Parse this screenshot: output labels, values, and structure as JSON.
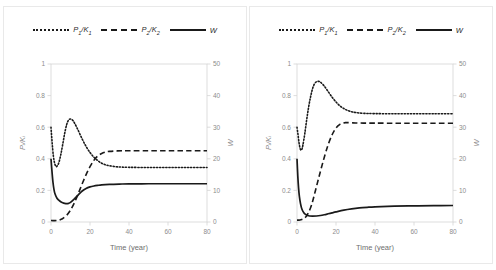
{
  "figure": {
    "panel_count": 2,
    "background": "#ffffff",
    "border_color": "#e9e9e9",
    "line_color": "#1a1a1a",
    "axis_color": "#d4d4d4",
    "tick_label_color": "#8c8c8c"
  },
  "legend": {
    "position": "top-center",
    "items": [
      {
        "label": "P",
        "sub": "1",
        "denom": "K",
        "denom_sub": "1",
        "style": "dotted",
        "name": "p1-over-k1"
      },
      {
        "label": "P",
        "sub": "2",
        "denom": "K",
        "denom_sub": "2",
        "style": "dashed",
        "name": "p2-over-k2"
      },
      {
        "label": "W",
        "sub": "",
        "denom": "",
        "denom_sub": "",
        "style": "solid",
        "name": "w"
      }
    ]
  },
  "chart_data": [
    {
      "type": "line",
      "panel": "left",
      "title": "",
      "xlabel": "Time (year)",
      "ylabel": "Pᵢ/Kᵢ",
      "y2label": "W",
      "xlim": [
        0,
        80
      ],
      "ylim": [
        0,
        1
      ],
      "y2lim": [
        0,
        50
      ],
      "xticks": [
        0,
        20,
        40,
        60,
        80
      ],
      "yticks": [
        0,
        0.2,
        0.4,
        0.6,
        0.8,
        1
      ],
      "y2ticks": [
        0,
        10,
        20,
        30,
        40,
        50
      ],
      "grid": false,
      "legend_position": "top-center",
      "series": [
        {
          "name": "P1/K1",
          "style": "dotted",
          "axis": "left",
          "x": [
            0,
            0.6,
            1.2,
            1.8,
            2.4,
            3,
            4,
            5,
            6,
            7,
            8,
            9,
            10,
            11,
            12,
            14,
            16,
            18,
            20,
            22,
            24,
            26,
            28,
            30,
            34,
            40,
            50,
            60,
            70,
            80
          ],
          "values": [
            0.6,
            0.5,
            0.42,
            0.375,
            0.355,
            0.352,
            0.375,
            0.425,
            0.49,
            0.56,
            0.615,
            0.645,
            0.652,
            0.645,
            0.628,
            0.578,
            0.525,
            0.478,
            0.44,
            0.41,
            0.388,
            0.372,
            0.362,
            0.356,
            0.349,
            0.346,
            0.345,
            0.345,
            0.345,
            0.345
          ]
        },
        {
          "name": "P2/K2",
          "style": "dashed",
          "axis": "left",
          "x": [
            0,
            1,
            2,
            3,
            4,
            5,
            6,
            8,
            10,
            12,
            14,
            16,
            18,
            20,
            22,
            24,
            26,
            28,
            30,
            34,
            40,
            50,
            60,
            70,
            80
          ],
          "values": [
            0.01,
            0.009,
            0.009,
            0.01,
            0.012,
            0.016,
            0.022,
            0.042,
            0.075,
            0.122,
            0.18,
            0.242,
            0.3,
            0.35,
            0.39,
            0.418,
            0.434,
            0.443,
            0.447,
            0.45,
            0.451,
            0.451,
            0.451,
            0.451,
            0.451
          ]
        },
        {
          "name": "W",
          "style": "solid",
          "axis": "right",
          "x": [
            0,
            0.5,
            1,
            1.5,
            2,
            3,
            4,
            5,
            6,
            7,
            8,
            9,
            10,
            12,
            14,
            16,
            18,
            20,
            22,
            24,
            26,
            30,
            35,
            40,
            50,
            60,
            70,
            80
          ],
          "values": [
            20.0,
            16.0,
            12.6,
            10.4,
            9.0,
            7.6,
            6.9,
            6.4,
            6.1,
            5.9,
            5.8,
            5.9,
            6.2,
            7.3,
            8.6,
            9.8,
            10.6,
            11.1,
            11.4,
            11.6,
            11.75,
            11.9,
            12.0,
            12.05,
            12.1,
            12.1,
            12.1,
            12.1
          ]
        }
      ]
    },
    {
      "type": "line",
      "panel": "right",
      "title": "",
      "xlabel": "Time (year)",
      "ylabel": "Pᵢ/Kᵢ",
      "y2label": "W",
      "xlim": [
        0,
        80
      ],
      "ylim": [
        0,
        1
      ],
      "y2lim": [
        0,
        50
      ],
      "xticks": [
        0,
        20,
        40,
        60,
        80
      ],
      "yticks": [
        0,
        0.2,
        0.4,
        0.6,
        0.8,
        1
      ],
      "y2ticks": [
        0,
        10,
        20,
        30,
        40,
        50
      ],
      "grid": false,
      "legend_position": "top-center",
      "series": [
        {
          "name": "P1/K1",
          "style": "dotted",
          "axis": "left",
          "x": [
            0,
            0.5,
            1,
            1.5,
            2,
            2.5,
            3,
            4,
            5,
            6,
            7,
            8,
            9,
            10,
            11,
            12,
            14,
            16,
            18,
            20,
            22,
            24,
            26,
            28,
            30,
            34,
            40,
            50,
            60,
            70,
            80
          ],
          "values": [
            0.6,
            0.555,
            0.505,
            0.47,
            0.455,
            0.46,
            0.485,
            0.56,
            0.65,
            0.73,
            0.795,
            0.845,
            0.875,
            0.888,
            0.89,
            0.885,
            0.86,
            0.825,
            0.79,
            0.76,
            0.735,
            0.718,
            0.706,
            0.698,
            0.693,
            0.688,
            0.686,
            0.685,
            0.685,
            0.685,
            0.685
          ]
        },
        {
          "name": "P2/K2",
          "style": "dashed",
          "axis": "left",
          "x": [
            0,
            1,
            2,
            3,
            4,
            5,
            6,
            7,
            8,
            10,
            12,
            14,
            16,
            18,
            20,
            22,
            24,
            25,
            26,
            28,
            30,
            34,
            40,
            50,
            60,
            70,
            80
          ],
          "values": [
            0.012,
            0.012,
            0.014,
            0.018,
            0.026,
            0.04,
            0.062,
            0.092,
            0.13,
            0.225,
            0.32,
            0.41,
            0.49,
            0.552,
            0.595,
            0.618,
            0.627,
            0.629,
            0.629,
            0.628,
            0.627,
            0.626,
            0.626,
            0.625,
            0.625,
            0.625,
            0.625
          ]
        },
        {
          "name": "W",
          "style": "solid",
          "axis": "right",
          "x": [
            0,
            0.4,
            0.8,
            1.2,
            1.8,
            2.5,
            3.5,
            4.5,
            5.5,
            6.5,
            8,
            10,
            12,
            14,
            16,
            18,
            20,
            24,
            28,
            32,
            36,
            40,
            50,
            60,
            70,
            80
          ],
          "values": [
            20.0,
            14.6,
            10.8,
            8.2,
            5.8,
            4.1,
            2.9,
            2.35,
            2.05,
            1.9,
            1.85,
            1.9,
            2.05,
            2.3,
            2.6,
            2.9,
            3.2,
            3.75,
            4.15,
            4.45,
            4.65,
            4.8,
            5.0,
            5.1,
            5.18,
            5.22
          ]
        }
      ]
    }
  ]
}
